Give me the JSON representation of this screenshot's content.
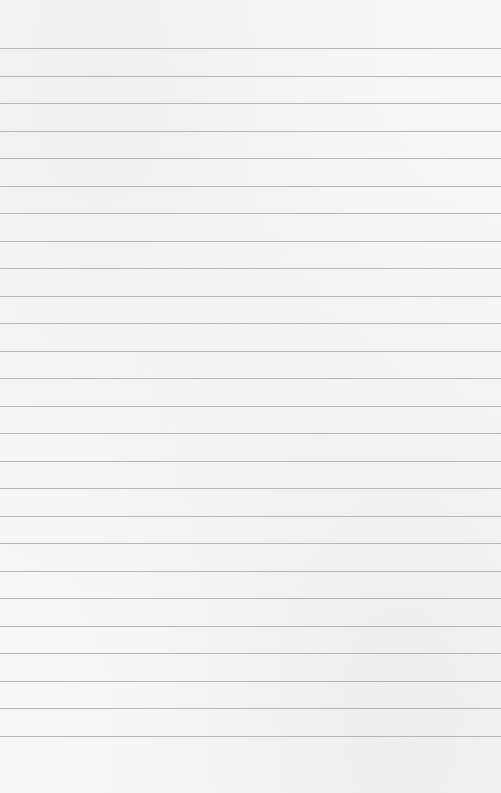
{
  "paper": {
    "type": "lined-paper",
    "background_color": "#f7f7f6",
    "line_color": "#a9a9a9",
    "first_line_y": 48,
    "line_spacing": 27.52,
    "line_count": 26
  }
}
